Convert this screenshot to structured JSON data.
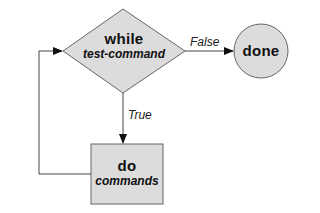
{
  "diagram": {
    "type": "flowchart",
    "colors": {
      "shape_fill": "#dcdcdc",
      "stroke": "#555555",
      "text": "#111111",
      "background": "#ffffff"
    },
    "nodes": {
      "condition": {
        "shape": "diamond",
        "keyword": "while",
        "argument": "test-command"
      },
      "body": {
        "shape": "rectangle",
        "keyword": "do",
        "argument": "commands"
      },
      "end": {
        "shape": "circle",
        "keyword": "done"
      }
    },
    "edges": {
      "false_edge": {
        "from": "condition",
        "to": "end",
        "label": "False"
      },
      "true_edge": {
        "from": "condition",
        "to": "body",
        "label": "True"
      },
      "loop_back": {
        "from": "body",
        "to": "condition",
        "label": ""
      }
    }
  }
}
